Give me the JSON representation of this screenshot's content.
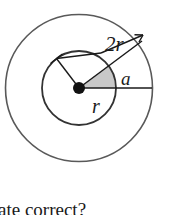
{
  "figure": {
    "background_color": "#ffffff",
    "stroke_color": "#4d4d4d",
    "line_color": "#1a1a1a",
    "sector_fill_color": "#c8c8c8",
    "geometry": {
      "center_x": 79,
      "center_y": 88,
      "inner_radius": 37,
      "outer_radius": 74
    },
    "labels": {
      "outer_radius_label": "2r",
      "inner_radius_label": "r",
      "angle_label": "a"
    },
    "center_point": {
      "name": "center-dot",
      "radius": 6
    }
  },
  "caption": {
    "text": "ate correct?",
    "note": "partially cropped line of body text at bottom edge"
  }
}
